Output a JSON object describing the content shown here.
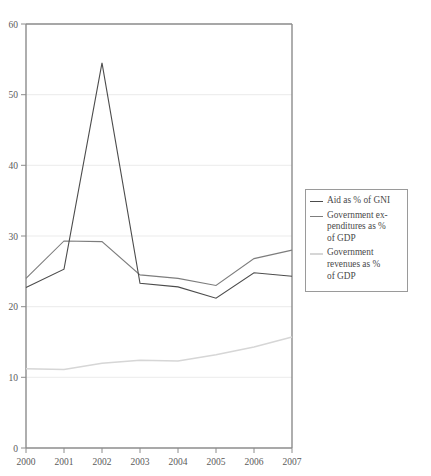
{
  "chart_data": {
    "type": "line",
    "title": "",
    "xlabel": "",
    "ylabel": "",
    "x": [
      "2000",
      "2001",
      "2002",
      "2003",
      "2004",
      "2005",
      "2006",
      "2007"
    ],
    "categories": [
      "2000",
      "2001",
      "2002",
      "2003",
      "2004",
      "2005",
      "2006",
      "2007"
    ],
    "xlim": [
      2000,
      2007
    ],
    "ylim": [
      0,
      60
    ],
    "yticks": [
      0,
      10,
      20,
      30,
      40,
      50,
      60
    ],
    "ytick_labels": [
      "0",
      "10",
      "20",
      "30",
      "40",
      "50",
      "60"
    ],
    "xtick_labels": [
      "2000",
      "2001",
      "2002",
      "2003",
      "2004",
      "2005",
      "2006",
      "2007"
    ],
    "grid": true,
    "grid_axis": "y",
    "legend_position": "right",
    "series": [
      {
        "name": "Aid as % of GNI",
        "color": "#4c4c4c",
        "values": [
          22.7,
          25.3,
          54.5,
          23.3,
          22.8,
          21.2,
          24.8,
          24.3
        ]
      },
      {
        "name": "Government expenditures as % of GDP",
        "color": "#7d7d7d",
        "values": [
          24.0,
          29.3,
          29.2,
          24.5,
          24.0,
          23.0,
          26.8,
          28.0
        ]
      },
      {
        "name": "Government revenues as % of GDP",
        "color": "#d6d6d6",
        "values": [
          11.2,
          11.1,
          12.0,
          12.4,
          12.3,
          13.2,
          14.3,
          15.7
        ]
      }
    ]
  },
  "legend": {
    "items": [
      {
        "label": "Aid as % of GNI",
        "color": "#4c4c4c"
      },
      {
        "label": "Government ex-\npenditures as %\nof GDP",
        "color": "#7d7d7d"
      },
      {
        "label": "Government\nrevenues as %\nof GDP",
        "color": "#d6d6d6"
      }
    ]
  },
  "colors": {
    "axis": "#8c8c8c",
    "grid": "#ebebeb",
    "text": "#5a5a5a",
    "background": "#ffffff"
  }
}
